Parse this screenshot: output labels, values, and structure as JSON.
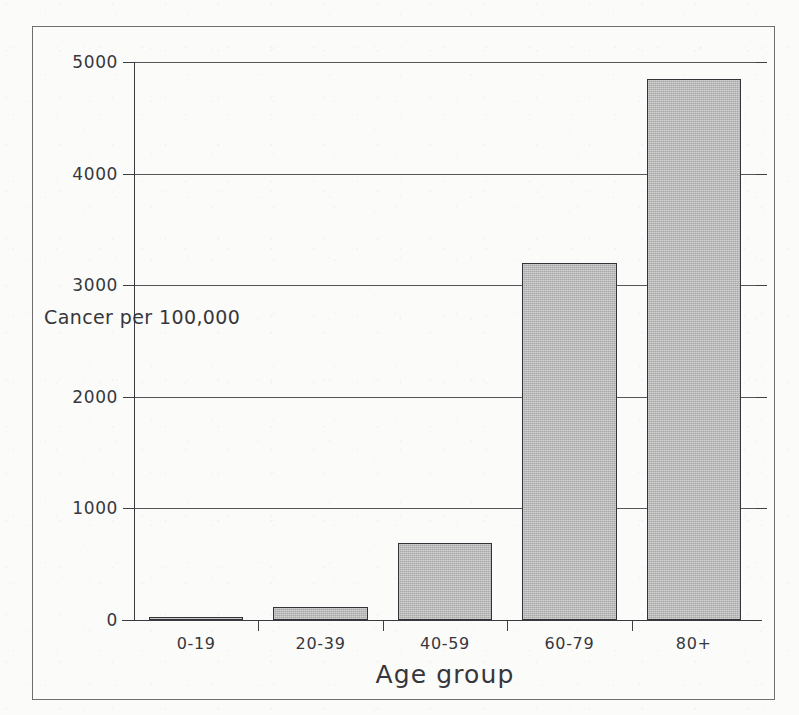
{
  "chart_data": {
    "type": "bar",
    "title": "",
    "subtitle": "",
    "xlabel": "Age group",
    "ylabel": "Cancer per 100,000",
    "ylabel_lines": [
      "Cancer",
      "per",
      "100,000"
    ],
    "categories": [
      "0-19",
      "20-39",
      "40-59",
      "60-79",
      "80+"
    ],
    "values": [
      25,
      120,
      690,
      3200,
      4850
    ],
    "ylim": [
      0,
      5000
    ],
    "ytick_labels": [
      "0",
      "1000",
      "2000",
      "3000",
      "4000",
      "5000"
    ],
    "ytick_values": [
      0,
      1000,
      2000,
      3000,
      4000,
      5000
    ],
    "grid": true,
    "legend": false,
    "legend_position": "none",
    "series": [
      {
        "name": "Cancer per 100,000",
        "values": [
          25,
          120,
          690,
          3200,
          4850
        ]
      }
    ],
    "bar_fill_color": "#b9b9b9",
    "bar_edge_color": "#333338",
    "axis_color": "#3a3a3f",
    "grid_color": "#55555a",
    "background_color": "#fbfbfa"
  }
}
